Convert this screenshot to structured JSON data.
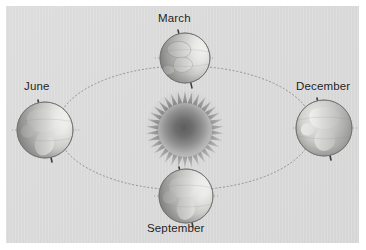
{
  "figure": {
    "background_color": "#ffffff",
    "panel_color": "#d9d9d9"
  },
  "sun": {
    "name": "Sun",
    "center": {
      "x": 185,
      "y": 130
    },
    "core_radius": 26,
    "spike_radius": 39,
    "spike_count": 34,
    "color_center": "#6e6e6e",
    "color_edge": "#c9c9c9"
  },
  "orbit": {
    "name": "Earth orbit ellipse",
    "center": {
      "x": 185,
      "y": 128
    },
    "radius_x": 128,
    "radius_y": 62,
    "style": "dotted",
    "color": "#8e8e8e",
    "stroke_width": 0.9
  },
  "positions": [
    {
      "id": "march",
      "label": "March",
      "x": 185,
      "y": 58,
      "radius": 25,
      "axis_tilt_deg": 23.5,
      "label_x": 158,
      "label_y": 12
    },
    {
      "id": "june",
      "label": "June",
      "x": 45,
      "y": 130,
      "radius": 28,
      "axis_tilt_deg": 23.5,
      "label_x": 24,
      "label_y": 80
    },
    {
      "id": "september",
      "label": "September",
      "x": 186,
      "y": 196,
      "radius": 27,
      "axis_tilt_deg": 23.5,
      "label_x": 147,
      "label_y": 222
    },
    {
      "id": "december",
      "label": "December",
      "x": 324,
      "y": 128,
      "radius": 28,
      "axis_tilt_deg": 23.5,
      "label_x": 296,
      "label_y": 80
    }
  ],
  "earth": {
    "globe_light": "#f2f2f0",
    "globe_mid": "#d0d0ce",
    "globe_shadow": "#8d8d8b",
    "land_color": "#e9e9e6",
    "outline_color": "#6f6f6f",
    "axis_color": "#3a3a3a"
  },
  "icons": {
    "sun": "sun-icon",
    "globe": "globe-icon",
    "axis": "axis-line-icon",
    "orbit": "orbit-ellipse-icon"
  }
}
